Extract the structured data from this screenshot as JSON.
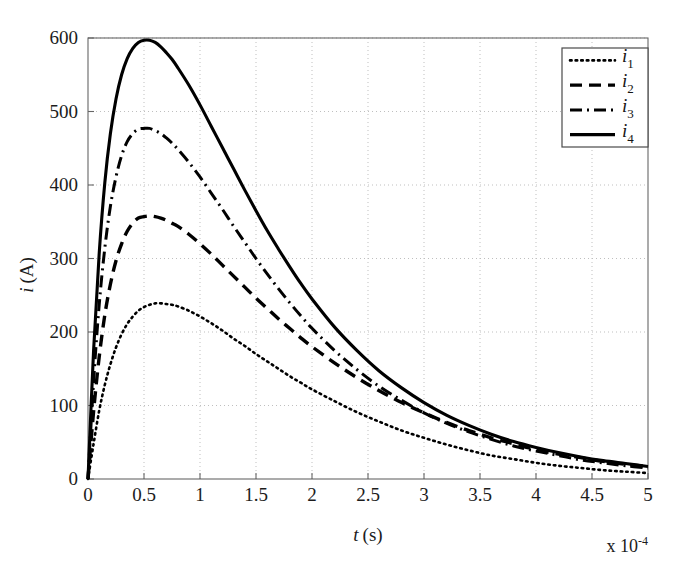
{
  "figure": {
    "background_color": "#ffffff",
    "axis_color": "#666666",
    "grid_color": "#bfbfbf",
    "curve_color": "#000000"
  },
  "axes": {
    "x_label_main": "t",
    "x_label_unit": "(s)",
    "y_label_main": "i",
    "y_label_unit": "(A)",
    "x_exponent_text": "x 10",
    "x_exponent_power": "-4",
    "x_ticks": [
      "0",
      "0.5",
      "1",
      "1.5",
      "2",
      "2.5",
      "3",
      "3.5",
      "4",
      "4.5",
      "5"
    ],
    "y_ticks": [
      "0",
      "100",
      "200",
      "300",
      "400",
      "500",
      "600"
    ]
  },
  "legend": {
    "position": "top-right",
    "entries": [
      {
        "base": "i",
        "sub": "1",
        "style": "dotted"
      },
      {
        "base": "i",
        "sub": "2",
        "style": "dashed"
      },
      {
        "base": "i",
        "sub": "3",
        "style": "dashdot"
      },
      {
        "base": "i",
        "sub": "4",
        "style": "solid"
      }
    ]
  },
  "chart_data": {
    "type": "line",
    "title": "",
    "xlabel": "t (s)",
    "ylabel": "i (A)",
    "xlim": [
      0,
      5
    ],
    "ylim": [
      0,
      600
    ],
    "x_multiplier": "1e-4",
    "x_unit": "s",
    "y_unit": "A",
    "grid": true,
    "grid_style": "dotted",
    "legend_position": "top-right",
    "x_tick_values": [
      0,
      0.5,
      1,
      1.5,
      2,
      2.5,
      3,
      3.5,
      4,
      4.5,
      5
    ],
    "y_tick_values": [
      0,
      100,
      200,
      300,
      400,
      500,
      600
    ],
    "x": [
      0,
      0.05,
      0.1,
      0.15,
      0.2,
      0.25,
      0.3,
      0.35,
      0.4,
      0.45,
      0.5,
      0.55,
      0.6,
      0.65,
      0.7,
      0.75,
      0.8,
      0.9,
      1.0,
      1.1,
      1.2,
      1.3,
      1.4,
      1.5,
      1.6,
      1.7,
      1.8,
      1.9,
      2.0,
      2.2,
      2.4,
      2.6,
      2.8,
      3.0,
      3.2,
      3.4,
      3.6,
      3.8,
      4.0,
      4.2,
      4.4,
      4.6,
      4.8,
      5.0
    ],
    "series": [
      {
        "name": "i1",
        "label": "i₁",
        "line_style": "dotted",
        "color": "#000000",
        "peak_value": 239,
        "peak_x": 0.62,
        "values": [
          0,
          48,
          93,
          128,
          156,
          179,
          197,
          211,
          221,
          229,
          234,
          237,
          239,
          239,
          238,
          237,
          235,
          229,
          221,
          212,
          202,
          191,
          181,
          170,
          160,
          150,
          140,
          131,
          122,
          106,
          91,
          78,
          66,
          56,
          47,
          39,
          32,
          27,
          22,
          18,
          15,
          12,
          10,
          8
        ]
      },
      {
        "name": "i2",
        "label": "i₂",
        "line_style": "dashed",
        "color": "#000000",
        "peak_value": 358,
        "peak_x": 0.57,
        "values": [
          0,
          92,
          166,
          223,
          265,
          297,
          320,
          337,
          348,
          355,
          357,
          358,
          357,
          355,
          352,
          348,
          344,
          333,
          320,
          306,
          291,
          276,
          261,
          246,
          232,
          218,
          205,
          192,
          180,
          158,
          138,
          120,
          104,
          90,
          77,
          66,
          56,
          48,
          40,
          34,
          29,
          24,
          20,
          17
        ]
      },
      {
        "name": "i3",
        "label": "i₃",
        "line_style": "dashdot",
        "color": "#000000",
        "peak_value": 477,
        "peak_x": 0.56,
        "values": [
          0,
          133,
          237,
          314,
          371,
          411,
          440,
          459,
          470,
          476,
          477,
          477,
          474,
          470,
          464,
          457,
          449,
          431,
          411,
          389,
          367,
          344,
          322,
          300,
          279,
          259,
          240,
          222,
          205,
          175,
          149,
          126,
          107,
          90,
          76,
          64,
          54,
          45,
          38,
          32,
          26,
          22,
          18,
          15
        ]
      },
      {
        "name": "i4",
        "label": "i₄",
        "line_style": "solid",
        "color": "#000000",
        "peak_value": 597,
        "peak_x": 0.55,
        "values": [
          0,
          175,
          307,
          403,
          470,
          517,
          550,
          572,
          586,
          594,
          597,
          597,
          594,
          588,
          580,
          571,
          560,
          536,
          509,
          480,
          451,
          422,
          393,
          365,
          338,
          313,
          289,
          266,
          245,
          207,
          175,
          147,
          124,
          104,
          87,
          73,
          61,
          51,
          43,
          36,
          30,
          25,
          21,
          17
        ]
      }
    ]
  }
}
